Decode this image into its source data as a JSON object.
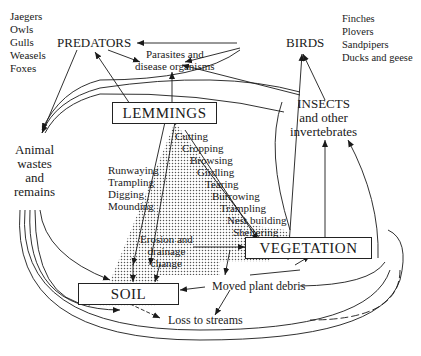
{
  "predators": {
    "title": "PREDATORS",
    "members": [
      "Jaegers",
      "Owls",
      "Gulls",
      "Weasels",
      "Foxes"
    ]
  },
  "birds": {
    "title": "BIRDS",
    "members": [
      "Finches",
      "Plovers",
      "Sandpipers",
      "Ducks and geese"
    ]
  },
  "parasites": {
    "line1": "Parasites and",
    "line2": "disease organisms"
  },
  "lemmings": {
    "title": "LEMMINGS"
  },
  "insects": {
    "line1": "INSECTS",
    "line2": "and other",
    "line3": "invertebrates"
  },
  "animal_wastes": {
    "line1": "Animal",
    "line2": "wastes",
    "line3": "and",
    "line4": "remains"
  },
  "soil_actions": [
    "Runwaying",
    "Trampling",
    "Digging",
    "Mounding"
  ],
  "vegetation_actions": [
    "Cutting",
    "Cropping",
    "Browsing",
    "Girdling",
    "Tearing",
    "Burrowing",
    "Trampling",
    "Nest building",
    "Sheltering"
  ],
  "erosion": {
    "line1": "Erosion and",
    "line2": "drainage",
    "line3": "change"
  },
  "vegetation": {
    "title": "VEGETATION"
  },
  "soil": {
    "title": "SOIL"
  },
  "moved_debris": "Moved plant debris",
  "loss_streams": "Loss to streams"
}
